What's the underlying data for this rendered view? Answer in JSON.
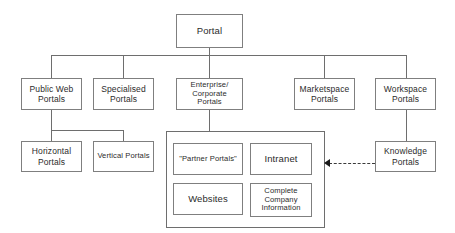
{
  "diagram": {
    "type": "tree-diagram",
    "colors": {
      "background": "#ffffff",
      "box_border": "#7f7f7f",
      "group_border": "#6e6e6e",
      "connector": "#6e6e6e",
      "text": "#2b2b2b",
      "arrow": "#1a1a1a"
    },
    "root": {
      "label": "Portal"
    },
    "level2": [
      {
        "label": "Public Web\nPortals"
      },
      {
        "label": "Specialised\nPortals"
      },
      {
        "label": "Enterprise/\nCorporate\nPortals"
      },
      {
        "label": "Marketspace\nPortals"
      },
      {
        "label": "Workspace\nPortals"
      }
    ],
    "level3": [
      {
        "label": "Horizontal\nPortals"
      },
      {
        "label": "Vertical Portals"
      },
      {
        "label": "Knowledge\nPortals"
      }
    ],
    "enterprise_group": {
      "items": [
        {
          "label": "\"Partner Portals\""
        },
        {
          "label": "Intranet"
        },
        {
          "label": "Websites"
        },
        {
          "label": "Complete\nCompany\nInformation"
        }
      ]
    },
    "arrow": {
      "name": "knowledge-to-enterprise-arrow",
      "style": "dashed",
      "direction": "left",
      "from": "Knowledge Portals",
      "to": "Enterprise/Corporate Portals group"
    }
  }
}
